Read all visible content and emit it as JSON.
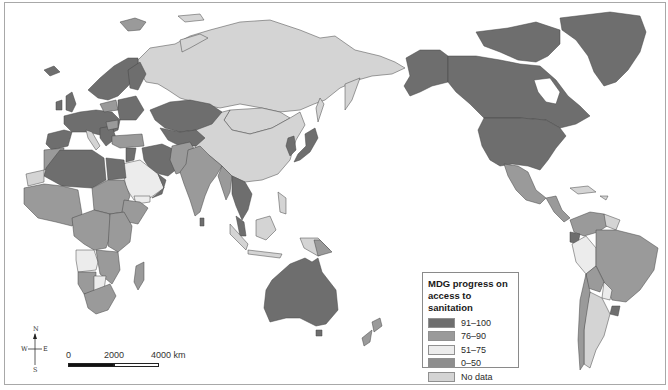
{
  "legend": {
    "title": "MDG progress on access to sanitation",
    "title_line1": "MDG progress on",
    "title_line2": "access to sanitation",
    "items": [
      {
        "label": "91–100",
        "color": "#6e6e6e"
      },
      {
        "label": "76–90",
        "color": "#9a9a9a"
      },
      {
        "label": "51–75",
        "color": "#ececec"
      },
      {
        "label": "0–50",
        "color": "#8e8e8e"
      },
      {
        "label": "No data",
        "color": "#d4d4d4"
      }
    ]
  },
  "scale_bar": {
    "labels": [
      "0",
      "2000",
      "4000 km"
    ]
  },
  "compass": {
    "n": "N",
    "s": "S",
    "e": "E",
    "w": "W"
  },
  "colors": {
    "ocean": "#ffffff",
    "border": "#3a3a3a",
    "frame": "#a8a8a8"
  }
}
